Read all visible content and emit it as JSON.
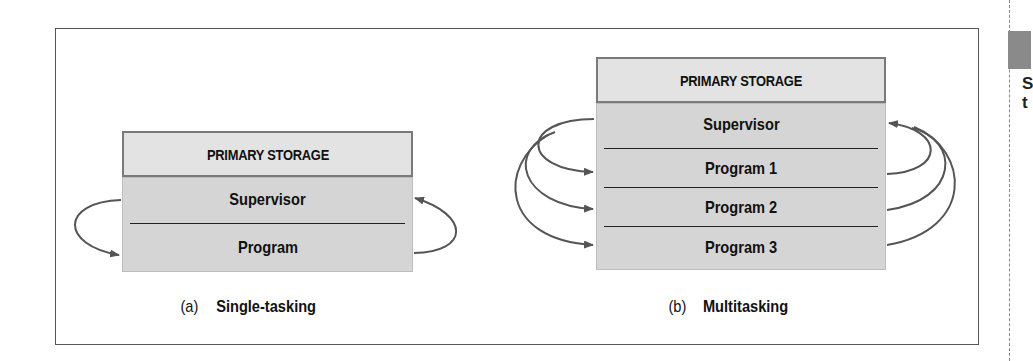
{
  "diagram": {
    "panels": [
      {
        "id": "single",
        "header": "PRIMARY STORAGE",
        "rows": [
          "Supervisor",
          "Program"
        ],
        "caption_tag": "(a)",
        "caption_text": "Single-tasking"
      },
      {
        "id": "multi",
        "header": "PRIMARY STORAGE",
        "rows": [
          "Supervisor",
          "Program 1",
          "Program 2",
          "Program 3"
        ],
        "caption_tag": "(b)",
        "caption_text": "Multitasking"
      }
    ],
    "side_text": [
      "S",
      "t"
    ],
    "colors": {
      "header_fill": "#e3e3e3",
      "body_fill": "#d5d5d5",
      "arrow": "#555555",
      "side_block": "#8a8a8a"
    }
  }
}
